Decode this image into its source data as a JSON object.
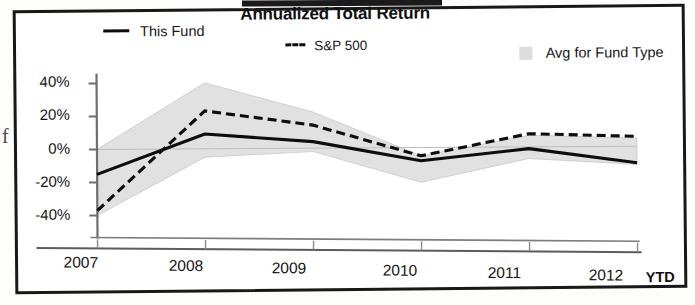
{
  "figure": {
    "title": "Annualized Total Return",
    "page_edge_glyph": "f"
  },
  "legend": [
    {
      "label": "This Fund",
      "marker": "solid-line-swatch",
      "color": "#0d0d0d"
    },
    {
      "label": "S&P 500",
      "marker": "dashed-line-swatch",
      "color": "#0d0d0d"
    },
    {
      "label": "Avg for Fund Type",
      "marker": "gray-band-swatch",
      "color": "#dcdcdc"
    }
  ],
  "axis": {
    "y_ticks": [
      "40%",
      "20%",
      "0%",
      "-20%",
      "-40%"
    ],
    "x_ticks": [
      "2007",
      "2008",
      "2009",
      "2010",
      "2011",
      "2012"
    ],
    "x_suffix": "YTD"
  },
  "chart_data": {
    "type": "line",
    "title": "Annualized Total Return",
    "xlabel": "",
    "ylabel": "",
    "categories": [
      "2007",
      "2008",
      "2009",
      "2010",
      "2011",
      "2012 YTD"
    ],
    "x": [
      2007,
      2008,
      2009,
      2010,
      2011,
      2012
    ],
    "ylim": [
      -45,
      45
    ],
    "yticks": [
      40,
      20,
      0,
      -20,
      -40
    ],
    "ytick_labels": [
      "40%",
      "20%",
      "0%",
      "-20%",
      "-40%"
    ],
    "grid": false,
    "zero_line": true,
    "legend_position": "top",
    "series": [
      {
        "name": "This Fund",
        "style": "solid",
        "color": "#0d0d0d",
        "values": [
          -15,
          9,
          4,
          -8,
          -1,
          -10
        ]
      },
      {
        "name": "S&P 500",
        "style": "dashed",
        "color": "#0d0d0d",
        "values": [
          -37,
          23,
          14,
          -5,
          8,
          6
        ]
      },
      {
        "name": "Avg for Fund Type",
        "style": "band",
        "color": "#dcdcdc",
        "band_upper": [
          0,
          40,
          22,
          -5,
          7,
          5
        ],
        "band_lower": [
          -40,
          -5,
          -2,
          -21,
          -7,
          -11
        ]
      }
    ],
    "annotations": [
      {
        "text": "YTD",
        "position": "after-last-x-tick",
        "bold": true
      }
    ]
  }
}
